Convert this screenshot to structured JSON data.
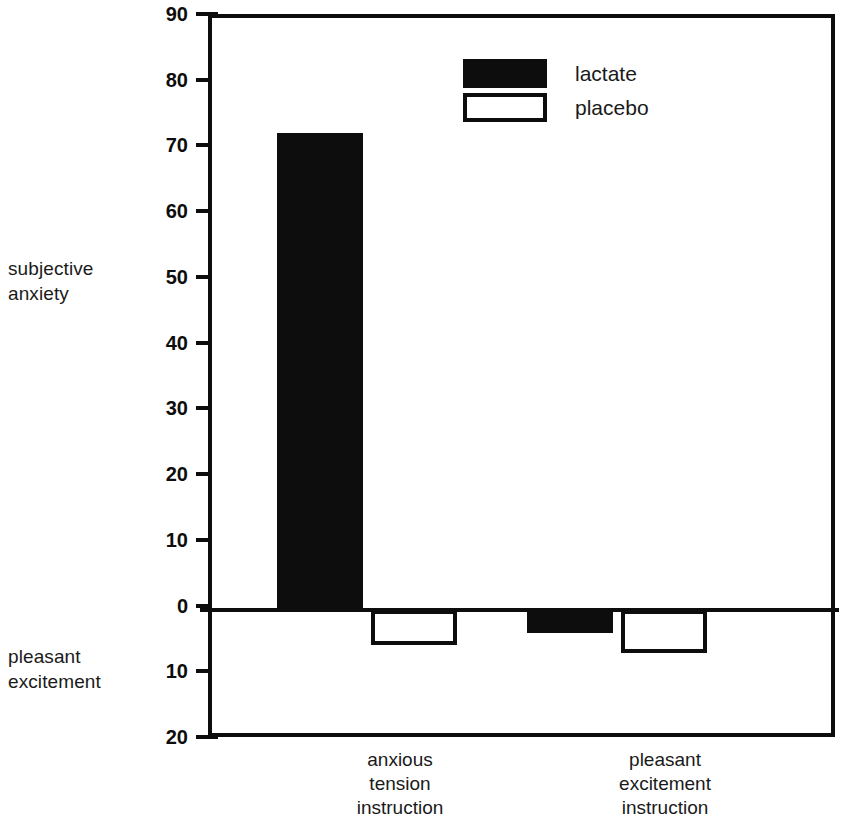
{
  "chart_data": {
    "type": "bar",
    "title": "",
    "xlabel": "",
    "ylabel": "",
    "categories": [
      "anxious tension instruction",
      "pleasant excitement instruction"
    ],
    "series": [
      {
        "name": "lactate",
        "values": [
          72.5,
          -3.5
        ]
      },
      {
        "name": "placebo",
        "values": [
          -5.4,
          -6.6
        ]
      }
    ],
    "ylim": [
      -20,
      90
    ],
    "ytick_values": [
      90,
      80,
      70,
      60,
      50,
      40,
      30,
      20,
      10,
      0,
      -10,
      -20
    ],
    "ytick_labels": [
      "90",
      "80",
      "70",
      "60",
      "50",
      "40",
      "30",
      "20",
      "10",
      "0",
      "10",
      "20"
    ],
    "axis_direction_labels": {
      "positive": "subjective\nanxiety",
      "negative": "pleasant\nexcitement"
    },
    "grid": false,
    "legend_position": "top-center",
    "colors": {
      "lactate": "#0d0d0d",
      "placebo": "#ffffff",
      "outline": "#0d0d0d",
      "background": "#ffffff"
    }
  },
  "axis": {
    "top_label": "subjective\nanxiety",
    "bottom_label": "pleasant\nexcitement"
  },
  "legend": {
    "items": [
      {
        "label": "lactate",
        "style": "filled"
      },
      {
        "label": "placebo",
        "style": "open"
      }
    ]
  },
  "x_categories": [
    {
      "label": "anxious\ntension\ninstruction"
    },
    {
      "label": "pleasant\nexcitement\ninstruction"
    }
  ]
}
